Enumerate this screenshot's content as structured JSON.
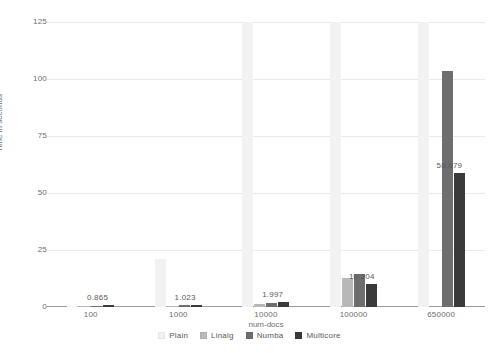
{
  "chart_data": {
    "type": "bar",
    "title": "",
    "subtitle": "",
    "xlabel": "num-docs",
    "ylabel": "Time in seconds",
    "categories": [
      "100",
      "1000",
      "10000",
      "100000",
      "650000"
    ],
    "series": [
      {
        "name": "Plain",
        "color": "#f2f2f2",
        "values": [
          0.3,
          21.0,
          132.0,
          360.0,
          2100.0
        ]
      },
      {
        "name": "Linalg",
        "color": "#b8b8b8",
        "values": [
          0.35,
          0.55,
          1.2,
          12.6,
          0.0
        ]
      },
      {
        "name": "Numba",
        "color": "#6e6e6e",
        "values": [
          0.6,
          0.8,
          1.6,
          14.4,
          103.5
        ]
      },
      {
        "name": "Multicore",
        "color": "#3a3a3a",
        "values": [
          0.865,
          1.023,
          1.997,
          10.204,
          58.679
        ]
      }
    ],
    "data_labels": [
      "0.865",
      "1.023",
      "1.997",
      "10.204",
      "58.679"
    ],
    "yticks": [
      0,
      25,
      50,
      75,
      100,
      125
    ],
    "ylim": [
      0,
      125
    ],
    "grid": true,
    "legend_position": "bottom",
    "axis_color": "#9a9a9a",
    "grid_color": "#e9e9e9",
    "text_color": "#6d6d6d"
  },
  "legend": {
    "items": [
      {
        "label": "Plain"
      },
      {
        "label": "Linalg"
      },
      {
        "label": "Numba"
      },
      {
        "label": "Multicore"
      }
    ]
  }
}
